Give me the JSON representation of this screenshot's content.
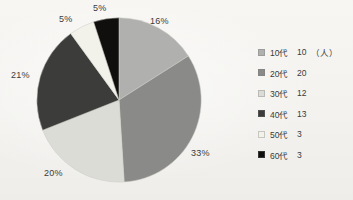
{
  "chart_data": {
    "type": "pie",
    "title": "",
    "subtitle": "",
    "xlabel": "",
    "ylabel": "",
    "legend_position": "right",
    "grid": false,
    "start_angle_deg": 0,
    "direction": "clockwise",
    "unit_note": "（人）",
    "total": 61,
    "categories": [
      "10代",
      "20代",
      "30代",
      "40代",
      "50代",
      "60代"
    ],
    "values": [
      10,
      20,
      12,
      13,
      3,
      3
    ],
    "percent_labels": [
      "16%",
      "33%",
      "20%",
      "21%",
      "5%",
      "5%"
    ],
    "percents": [
      16,
      33,
      20,
      21,
      5,
      5
    ],
    "colors": [
      "#b0b0ae",
      "#8a8a88",
      "#dcdcd6",
      "#3c3c3a",
      "#f2f1ea",
      "#100f0d"
    ],
    "slices": [
      {
        "label": "10代",
        "value": 10,
        "percent": 16,
        "percent_label": "16%",
        "color": "#b0b0ae"
      },
      {
        "label": "20代",
        "value": 20,
        "percent": 33,
        "percent_label": "33%",
        "color": "#8a8a88"
      },
      {
        "label": "30代",
        "value": 12,
        "percent": 20,
        "percent_label": "20%",
        "color": "#dcdcd6"
      },
      {
        "label": "40代",
        "value": 13,
        "percent": 21,
        "percent_label": "21%",
        "color": "#3c3c3a"
      },
      {
        "label": "50代",
        "value": 3,
        "percent": 5,
        "percent_label": "5%",
        "color": "#f2f1ea"
      },
      {
        "label": "60代",
        "value": 3,
        "percent": 5,
        "percent_label": "5%",
        "color": "#100f0d"
      }
    ]
  },
  "legend": {
    "rows": [
      {
        "label": "10代",
        "value": "10",
        "unit": "（人）",
        "color": "#b0b0ae"
      },
      {
        "label": "20代",
        "value": "20",
        "unit": "",
        "color": "#8a8a88"
      },
      {
        "label": "30代",
        "value": "12",
        "unit": "",
        "color": "#dcdcd6"
      },
      {
        "label": "40代",
        "value": "13",
        "unit": "",
        "color": "#3c3c3a"
      },
      {
        "label": "50代",
        "value": "3",
        "unit": "",
        "color": "#f2f1ea"
      },
      {
        "label": "60代",
        "value": "3",
        "unit": "",
        "color": "#100f0d"
      }
    ]
  },
  "background_color": "#f3f2ef",
  "label_color": "#3b3b3b"
}
